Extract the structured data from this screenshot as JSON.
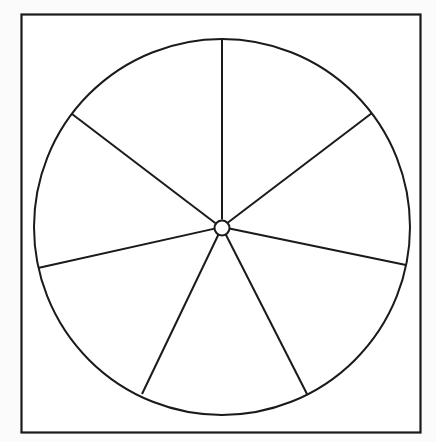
{
  "figure": {
    "canvas": {
      "width": 436,
      "height": 442
    },
    "background_color": "#fbfbfb",
    "ink_color": "#1a1a1a",
    "fill_color": "#ffffff"
  },
  "frame": {
    "name": "border-rectangle",
    "x": 21.5,
    "y": 14.5,
    "width": 399,
    "height": 418,
    "stroke_width": 2.2,
    "stroke": "#1a1a1a",
    "fill": "#ffffff"
  },
  "wheel": {
    "name": "sector-circle",
    "center_x": 222,
    "center_y": 227,
    "radius": 188,
    "stroke_width": 2.0,
    "stroke": "#1a1a1a",
    "fill": "#ffffff"
  },
  "hub": {
    "name": "center-hub",
    "center_x": 222,
    "center_y": 228,
    "radius": 7.5,
    "stroke_width": 2.0,
    "stroke": "#1a1a1a",
    "fill": "#ffffff"
  },
  "chart_data": {
    "type": "pie",
    "xlabel": "",
    "ylabel": "",
    "legend": "none",
    "grid": false,
    "labels_shown": false,
    "values_shown": false,
    "center": [
      222,
      227
    ],
    "radius": 188,
    "hub_radius": 7.5,
    "total_degrees": 360,
    "categories": [
      "sector-1",
      "sector-2",
      "sector-3",
      "sector-4",
      "sector-5",
      "sector-6",
      "sector-7"
    ],
    "values": [
      60.4,
      42.1,
      52.3,
      52.1,
      51.5,
      49.1,
      52.5
    ],
    "spokes": [
      {
        "name": "spoke-top",
        "angle_deg": 90.0,
        "end_x": 222,
        "end_y": 39
      },
      {
        "name": "spoke-upper-left",
        "angle_deg": 150.4,
        "end_x": 72,
        "end_y": 114
      },
      {
        "name": "spoke-left",
        "angle_deg": 192.5,
        "end_x": 38,
        "end_y": 268
      },
      {
        "name": "spoke-lower-left",
        "angle_deg": 244.8,
        "end_x": 142,
        "end_y": 394
      },
      {
        "name": "spoke-lower-right",
        "angle_deg": 296.9,
        "end_x": 307,
        "end_y": 394
      },
      {
        "name": "spoke-right",
        "angle_deg": 348.4,
        "end_x": 406,
        "end_y": 265
      },
      {
        "name": "spoke-upper-right",
        "angle_deg": 37.1,
        "end_x": 372,
        "end_y": 113
      }
    ]
  }
}
